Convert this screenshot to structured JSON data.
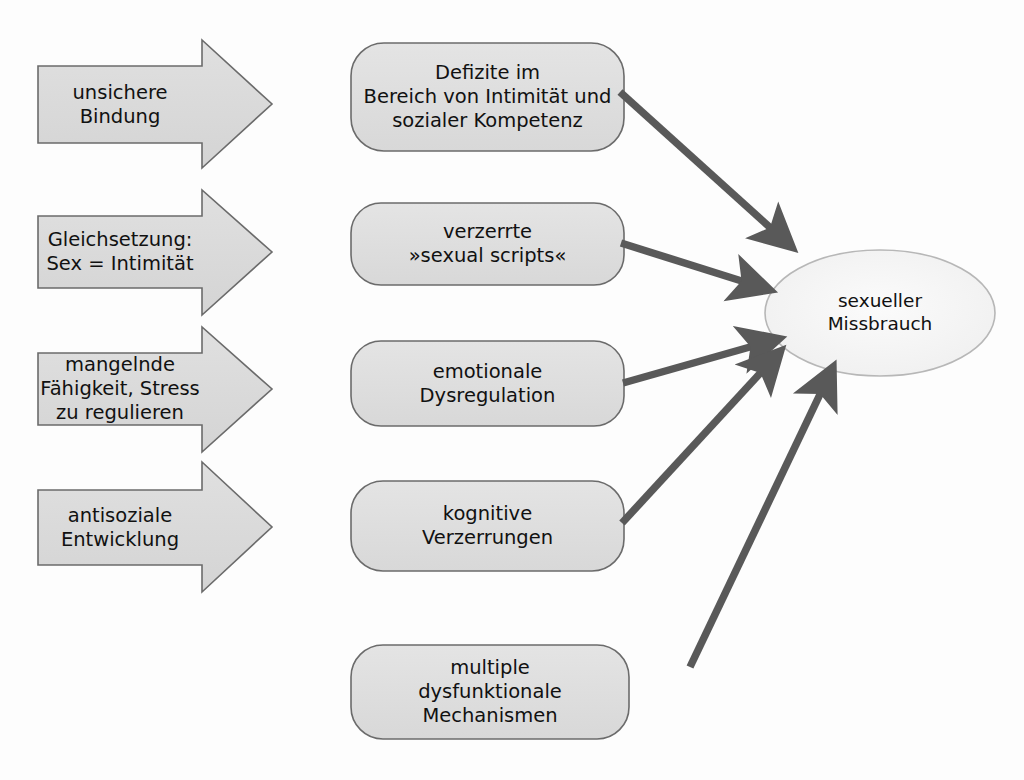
{
  "diagram": {
    "type": "flow-diagram",
    "background_color": "#fdfdfd",
    "colors": {
      "shape_fill": "#d9d9d9",
      "shape_fill_light": "#e2e2e2",
      "oval_fill": "#f2f2f2",
      "shape_stroke": "#6b6b6b",
      "connector": "#595959",
      "text": "#111111"
    },
    "risk_factors": [
      {
        "id": "unsichere-bindung",
        "shape": "block-arrow-right",
        "lines": [
          "unsichere",
          "Bindung"
        ],
        "text": "unsichere\nBindung"
      },
      {
        "id": "gleichsetzung-sex-intimitaet",
        "shape": "block-arrow-right",
        "lines": [
          "Gleichsetzung:",
          "Sex = Intimität"
        ],
        "text": "Gleichsetzung:\nSex = Intimität"
      },
      {
        "id": "mangelnde-faehigkeit-stress",
        "shape": "block-arrow-right",
        "lines": [
          "mangelnde",
          "Fähigkeit, Stress",
          "zu regulieren"
        ],
        "text": "mangelnde\nFähigkeit, Stress\nzu regulieren"
      },
      {
        "id": "antisoziale-entwicklung",
        "shape": "block-arrow-right",
        "lines": [
          "antisoziale",
          "Entwicklung"
        ],
        "text": "antisoziale\nEntwicklung"
      }
    ],
    "mechanisms": [
      {
        "id": "defizite-intimitaet",
        "shape": "rounded-rectangle",
        "lines": [
          "Defizite im",
          "Bereich von Intimität und",
          "sozialer Kompetenz"
        ],
        "text": "Defizite im\nBereich von Intimität und\nsozialer Kompetenz"
      },
      {
        "id": "verzerrte-sexual-scripts",
        "shape": "rounded-rectangle",
        "lines": [
          "verzerrte",
          "»sexual scripts«"
        ],
        "text": "verzerrte\n»sexual scripts«"
      },
      {
        "id": "emotionale-dysregulation",
        "shape": "rounded-rectangle",
        "lines": [
          "emotionale",
          "Dysregulation"
        ],
        "text": "emotionale\nDysregulation"
      },
      {
        "id": "kognitive-verzerrungen",
        "shape": "rounded-rectangle",
        "lines": [
          "kognitive",
          "Verzerrungen"
        ],
        "text": "kognitive\nVerzerrungen"
      },
      {
        "id": "multiple-dysfunktionale-mechanismen",
        "shape": "rounded-rectangle",
        "lines": [
          "multiple",
          "dysfunktionale",
          "Mechanismen"
        ],
        "text": "multiple\ndysfunktionale\nMechanismen"
      }
    ],
    "outcome": {
      "id": "sexueller-missbrauch",
      "shape": "ellipse",
      "lines": [
        "sexueller",
        "Missbrauch"
      ],
      "text": "sexueller\nMissbrauch"
    },
    "connectors": [
      {
        "from": "defizite-intimitaet",
        "to": "sexueller-missbrauch"
      },
      {
        "from": "verzerrte-sexual-scripts",
        "to": "sexueller-missbrauch"
      },
      {
        "from": "emotionale-dysregulation",
        "to": "sexueller-missbrauch"
      },
      {
        "from": "kognitive-verzerrungen",
        "to": "sexueller-missbrauch"
      },
      {
        "from": "multiple-dysfunktionale-mechanismen",
        "to": "sexueller-missbrauch"
      }
    ]
  }
}
